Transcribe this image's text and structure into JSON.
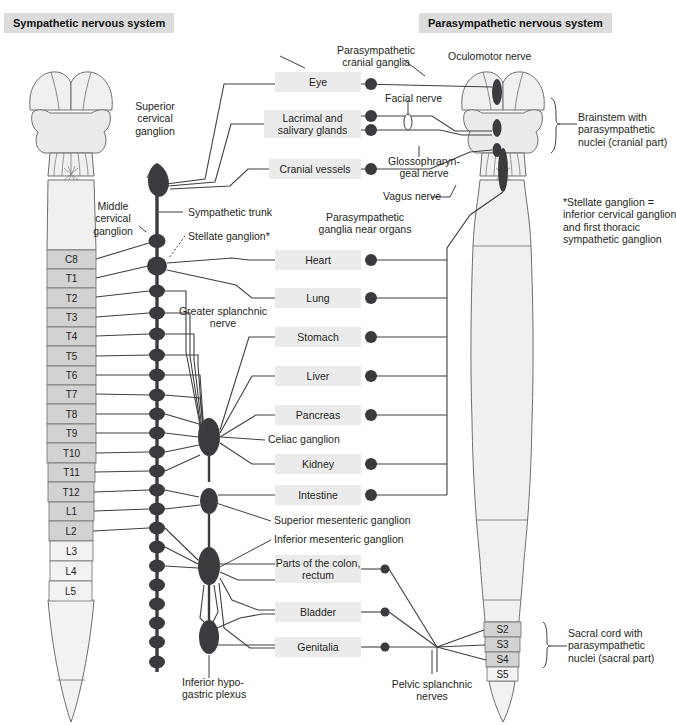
{
  "figure": {
    "title_left": "Sympathetic nervous system",
    "title_right": "Parasympathetic nervous system",
    "footnote": "*Stellate ganglion =\ninferior cervical ganglion\nand first thoracic\nsympathetic ganglion"
  },
  "sympathetic": {
    "labels": {
      "superior_cervical_ganglion": "Superior\ncervical\nganglion",
      "middle_cervical_ganglion": "Middle\ncervical\nganglion",
      "sympathetic_trunk": "Sympathetic trunk",
      "stellate_ganglion": "Stellate ganglion*",
      "greater_splanchnic_nerve": "Greater splanchnic\nnerve",
      "celiac_ganglion": "Celiac ganglion",
      "superior_mesenteric_ganglion": "Superior mesenteric ganglion",
      "inferior_mesenteric_ganglion": "Inferior mesenteric ganglion",
      "inferior_hypogastric_plexus": "Inferior hypo-\ngastric plexus"
    },
    "cord_segments": [
      {
        "id": "C8",
        "label": "C8",
        "shaded": true
      },
      {
        "id": "T1",
        "label": "T1",
        "shaded": true
      },
      {
        "id": "T2",
        "label": "T2",
        "shaded": true
      },
      {
        "id": "T3",
        "label": "T3",
        "shaded": true
      },
      {
        "id": "T4",
        "label": "T4",
        "shaded": true
      },
      {
        "id": "T5",
        "label": "T5",
        "shaded": true
      },
      {
        "id": "T6",
        "label": "T6",
        "shaded": true
      },
      {
        "id": "T7",
        "label": "T7",
        "shaded": true
      },
      {
        "id": "T8",
        "label": "T8",
        "shaded": true
      },
      {
        "id": "T9",
        "label": "T9",
        "shaded": true
      },
      {
        "id": "T10",
        "label": "T10",
        "shaded": true
      },
      {
        "id": "T11",
        "label": "T11",
        "shaded": true
      },
      {
        "id": "T12",
        "label": "T12",
        "shaded": true
      },
      {
        "id": "L1",
        "label": "L1",
        "shaded": true
      },
      {
        "id": "L2",
        "label": "L2",
        "shaded": true
      },
      {
        "id": "L3",
        "label": "L3",
        "shaded": false
      },
      {
        "id": "L4",
        "label": "L4",
        "shaded": false
      },
      {
        "id": "L5",
        "label": "L5",
        "shaded": false
      }
    ]
  },
  "parasympathetic": {
    "labels": {
      "cranial_ganglia": "Parasympathetic\ncranial ganglia",
      "oculomotor_nerve": "Oculomotor nerve",
      "facial_nerve": "Facial nerve",
      "glossopharyngeal_nerve": "Glossophraryn-\ngeal nerve",
      "vagus_nerve": "Vagus nerve",
      "ganglia_near_organs": "Parasympathetic\nganglia near organs",
      "brainstem": "Brainstem with\nparasympathetic\nnuclei (cranial part)",
      "sacral_cord": "Sacral cord with\nparasympathetic\nnuclei (sacral part)",
      "pelvic_splanchnic_nerves": "Pelvic splanchnic\nnerves"
    },
    "sacral_segments": [
      {
        "id": "S2",
        "label": "S2",
        "shaded": true
      },
      {
        "id": "S3",
        "label": "S3",
        "shaded": true
      },
      {
        "id": "S4",
        "label": "S4",
        "shaded": true
      },
      {
        "id": "S5",
        "label": "S5",
        "shaded": false
      }
    ]
  },
  "organs": [
    {
      "id": "eye",
      "label": "Eye",
      "x": 275,
      "y": 72,
      "w": 86,
      "h": 20,
      "ganglia": 1
    },
    {
      "id": "lacrimal",
      "label": "Lacrimal and\nsalivary glands",
      "x": 264,
      "y": 110,
      "w": 97,
      "h": 28,
      "ganglia": 2
    },
    {
      "id": "cranial-vessels",
      "label": "Cranial vessels",
      "x": 269,
      "y": 159,
      "w": 92,
      "h": 20,
      "ganglia": 1
    },
    {
      "id": "heart",
      "label": "Heart",
      "x": 275,
      "y": 250,
      "w": 86,
      "h": 20,
      "ganglia": 1
    },
    {
      "id": "lung",
      "label": "Lung",
      "x": 275,
      "y": 288,
      "w": 86,
      "h": 20,
      "ganglia": 1
    },
    {
      "id": "stomach",
      "label": "Stomach",
      "x": 275,
      "y": 327,
      "w": 86,
      "h": 20,
      "ganglia": 1
    },
    {
      "id": "liver",
      "label": "Liver",
      "x": 275,
      "y": 366,
      "w": 86,
      "h": 20,
      "ganglia": 1
    },
    {
      "id": "pancreas",
      "label": "Pancreas",
      "x": 275,
      "y": 405,
      "w": 86,
      "h": 20,
      "ganglia": 1
    },
    {
      "id": "kidney",
      "label": "Kidney",
      "x": 275,
      "y": 454,
      "w": 86,
      "h": 20,
      "ganglia": 1
    },
    {
      "id": "intestine",
      "label": "Intestine",
      "x": 275,
      "y": 485,
      "w": 86,
      "h": 20,
      "ganglia": 1
    },
    {
      "id": "colon-rectum",
      "label": "Parts of the\ncolon, rectum",
      "x": 275,
      "y": 555,
      "w": 86,
      "h": 28,
      "ganglia": 1
    },
    {
      "id": "bladder",
      "label": "Bladder",
      "x": 275,
      "y": 602,
      "w": 86,
      "h": 20,
      "ganglia": 1
    },
    {
      "id": "genitalia",
      "label": "Genitalia",
      "x": 275,
      "y": 637,
      "w": 86,
      "h": 20,
      "ganglia": 1
    }
  ],
  "colors": {
    "ganglion_fill": "#3b3b3f",
    "box_fill": "#ebebeb",
    "badge_fill": "#dcdcdc",
    "cord_fill": "#f0f0f0",
    "cord_shaded": "#d2d2d2",
    "cord_light": "#f2f2f2",
    "line": "#3f3f44",
    "outline": "#6e6e73"
  }
}
